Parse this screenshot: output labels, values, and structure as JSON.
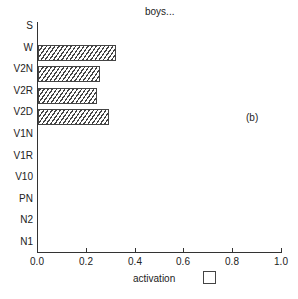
{
  "chart_data": {
    "type": "bar",
    "orientation": "horizontal",
    "title": "boys...",
    "panel_label": "(b)",
    "xlabel": "activation",
    "ylabel": "",
    "categories": [
      "S",
      "W",
      "V2N",
      "V2R",
      "V2D",
      "V1N",
      "V1R",
      "V10",
      "PN",
      "N2",
      "N1"
    ],
    "values": [
      0,
      0.32,
      0.255,
      0.24,
      0.29,
      0,
      0,
      0,
      0,
      0,
      0
    ],
    "xlim": [
      0.0,
      1.0
    ],
    "xticks": [
      "0.0",
      "0.2",
      "0.4",
      "0.6",
      "0.8",
      "1.0"
    ],
    "grid": false,
    "legend": {
      "entries": [
        ""
      ],
      "position": "bottom-right of xlabel",
      "swatch": "empty square"
    },
    "bar_fill": "diagonal hatch"
  }
}
